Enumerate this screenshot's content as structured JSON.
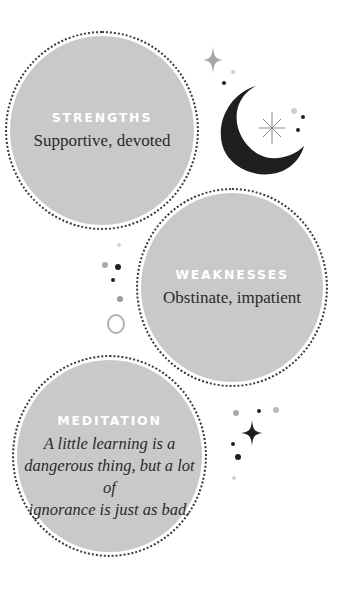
{
  "cards": {
    "strengths": {
      "title": "STRENGTHS",
      "text": "Supportive, devoted"
    },
    "weaknesses": {
      "title": "WEAKNESSES",
      "text": "Obstinate, impatient"
    },
    "meditation": {
      "title": "MEDITATION",
      "quote": "A little learning is a\ndangerous thing, but a lot of\nignorance is just as bad."
    }
  },
  "decorations": {
    "icons": [
      "crescent-moon-icon",
      "sparkle-icon",
      "starburst-icon",
      "ring-icon",
      "dot-icon"
    ]
  },
  "colors": {
    "circle_fill": "#c9c9c9",
    "title_text": "#ffffff",
    "body_text": "#2a2a2a",
    "moon": "#1f1f1f",
    "accent_gray": "#a8a8a8"
  }
}
